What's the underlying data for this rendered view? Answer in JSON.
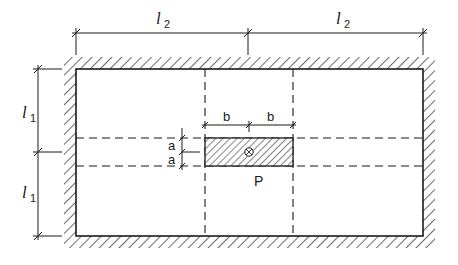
{
  "diagram": {
    "type": "slab plan with edge walls and rectangular patch load",
    "colors": {
      "line": "#1a1a1a",
      "background": "#ffffff"
    },
    "dimensions": {
      "top": [
        {
          "symbol": "l",
          "subscript": "2"
        },
        {
          "symbol": "l",
          "subscript": "2"
        }
      ],
      "left": [
        {
          "symbol": "l",
          "subscript": "1"
        },
        {
          "symbol": "l",
          "subscript": "1"
        }
      ],
      "patch_width": [
        "b",
        "b"
      ],
      "patch_height": [
        "a",
        "a"
      ]
    },
    "patch": {
      "label": "P",
      "center_marker": "circle-cross"
    },
    "supports": "hatched walls on all four edges",
    "gridlines": "dashed lines through patch edges"
  }
}
